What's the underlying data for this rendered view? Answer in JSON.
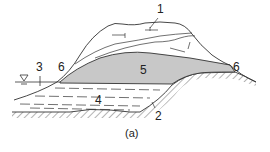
{
  "figure": {
    "caption": "(a)",
    "labels": {
      "l1": "1",
      "l2": "2",
      "l3": "3",
      "l4": "4",
      "l5": "5",
      "l6a": "6",
      "l6b": "6"
    },
    "water_symbol": "∇",
    "colors": {
      "stroke": "#333333",
      "lens_fill": "#c8c8c8",
      "background": "#ffffff"
    }
  }
}
